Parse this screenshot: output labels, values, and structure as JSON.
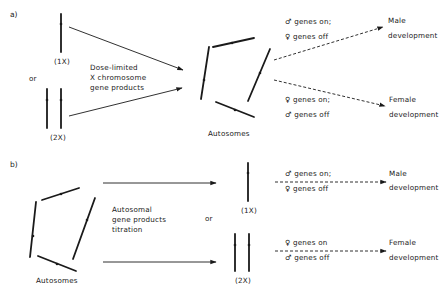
{
  "panels": {
    "a": {
      "label": "a)",
      "x_1x_label": "(1X)",
      "or_label": "or",
      "x_2x_label": "(2X)",
      "mechanism_line1": "Dose-limited",
      "mechanism_line2": "X chromosome",
      "mechanism_line3": "gene products",
      "autosomes_label": "Autosomes",
      "male_path": {
        "line1": "♂ genes on;",
        "line2": "♀ genes off",
        "outcome_line1": "Male",
        "outcome_line2": "development"
      },
      "female_path": {
        "line1": "♀ genes on;",
        "line2": "♂ genes off",
        "outcome_line1": "Female",
        "outcome_line2": "development"
      }
    },
    "b": {
      "label": "b)",
      "autosomes_label": "Autosomes",
      "mechanism_line1": "Autosomal",
      "mechanism_line2": "gene products",
      "mechanism_line3": "titration",
      "or_label": "or",
      "x_1x_label": "(1X)",
      "x_2x_label": "(2X)",
      "male_path": {
        "line1": "♂ genes on;",
        "line2": "♀ genes off",
        "outcome_line1": "Male",
        "outcome_line2": "development"
      },
      "female_path": {
        "line1": "♀ genes on",
        "line2": "♂ genes off",
        "outcome_line1": "Female",
        "outcome_line2": "development"
      }
    }
  },
  "colors": {
    "ink": "#1a1a1a",
    "background": "#ffffff"
  }
}
